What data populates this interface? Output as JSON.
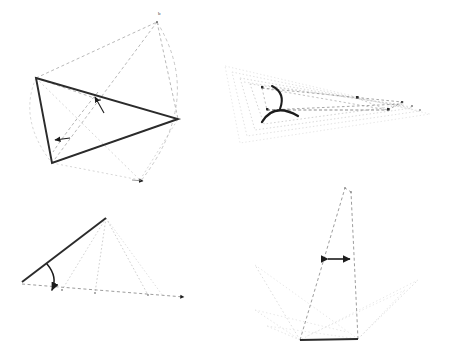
{
  "document": {
    "title": "Geometric Angle Constructions",
    "background_color": "#ffffff",
    "figure_count": 4
  },
  "palette": {
    "solid_stroke": "#2b2b2b",
    "dashed_stroke": "#8c8c8c",
    "dotted_faint": "#d2d2d2",
    "dotted_mid": "#b4b4b4",
    "arc_stroke": "#1c1c1c",
    "marker_fill": "#1c1c1c",
    "label_color": "#3a3a3a"
  },
  "figures": [
    {
      "id": "fig-1",
      "name": "quadrilateral-rotation-construction",
      "position": "top-left",
      "labels": [
        {
          "text": "b",
          "x": 160,
          "y": 14
        }
      ],
      "solid_polyline": [
        [
          36,
          78
        ],
        [
          178,
          119
        ],
        [
          52,
          163
        ],
        [
          36,
          78
        ]
      ],
      "dashed_lines": [
        [
          [
            36,
            78
          ],
          [
            157,
            22
          ]
        ],
        [
          [
            157,
            22
          ],
          [
            178,
            119
          ]
        ],
        [
          [
            157,
            22
          ],
          [
            52,
            163
          ]
        ],
        [
          [
            52,
            163
          ],
          [
            178,
            119
          ]
        ],
        [
          [
            36,
            78
          ],
          [
            140,
            180
          ]
        ],
        [
          [
            52,
            163
          ],
          [
            140,
            180
          ]
        ],
        [
          [
            140,
            180
          ],
          [
            178,
            119
          ]
        ],
        [
          [
            36,
            78
          ],
          [
            96,
            96
          ]
        ]
      ],
      "dashed_arcs": [
        {
          "from": [
            157,
            22
          ],
          "to": [
            140,
            182
          ],
          "bow": 28
        },
        {
          "from": [
            36,
            78
          ],
          "to": [
            52,
            163
          ],
          "bow": -22
        },
        {
          "from": [
            96,
            94
          ],
          "to": [
            52,
            150
          ],
          "bow": 16
        }
      ],
      "arrow_markers": [
        {
          "x": 93,
          "y": 100,
          "angle": -52
        },
        {
          "x": 54,
          "y": 140,
          "angle": 188
        },
        {
          "x": 141,
          "y": 181,
          "angle": 8
        }
      ],
      "vertex_dots": [
        [
          36,
          78
        ],
        [
          178,
          119
        ],
        [
          52,
          163
        ],
        [
          157,
          22
        ],
        [
          140,
          180
        ],
        [
          96,
          96
        ]
      ]
    },
    {
      "id": "fig-2",
      "name": "nested-triangle-angle-arcs",
      "position": "top-right",
      "labels": [],
      "solid_polyline": [],
      "dotted_polygons": [
        [
          [
            3,
            18
          ],
          [
            205,
            66
          ],
          [
            18,
            95
          ],
          [
            3,
            18
          ]
        ],
        [
          [
            10,
            24
          ],
          [
            196,
            62
          ],
          [
            25,
            88
          ],
          [
            10,
            24
          ]
        ],
        [
          [
            18,
            30
          ],
          [
            188,
            59
          ],
          [
            33,
            82
          ],
          [
            18,
            30
          ]
        ],
        [
          [
            28,
            36
          ],
          [
            180,
            56
          ],
          [
            42,
            76
          ],
          [
            28,
            36
          ]
        ]
      ],
      "dashed_lines": [
        [
          [
            40,
            40
          ],
          [
            178,
            54
          ]
        ],
        [
          [
            40,
            40
          ],
          [
            166,
            62
          ]
        ],
        [
          [
            45,
            62
          ],
          [
            180,
            56
          ]
        ],
        [
          [
            45,
            62
          ],
          [
            166,
            62
          ]
        ],
        [
          [
            40,
            40
          ],
          [
            45,
            62
          ]
        ],
        [
          [
            166,
            62
          ],
          [
            178,
            54
          ]
        ],
        [
          [
            135,
            50
          ],
          [
            166,
            62
          ]
        ],
        [
          [
            135,
            50
          ],
          [
            40,
            40
          ]
        ]
      ],
      "angle_arcs": [
        {
          "cx": 47,
          "cy": 44,
          "r": 14,
          "start_deg": -30,
          "end_deg": 72,
          "bold": true
        },
        {
          "cx": 52,
          "cy": 64,
          "r": 16,
          "start_deg": -100,
          "end_deg": 28,
          "bold": true
        }
      ],
      "vertex_dots": [
        [
          40,
          40
        ],
        [
          45,
          62
        ],
        [
          135,
          50
        ],
        [
          166,
          62
        ],
        [
          178,
          54
        ],
        [
          188,
          57
        ],
        [
          196,
          60
        ]
      ]
    },
    {
      "id": "fig-3",
      "name": "ray-rotation-angle-arc",
      "position": "bottom-left",
      "labels": [],
      "solid_lines": [
        [
          [
            22,
            87
          ],
          [
            106,
            23
          ]
        ]
      ],
      "dashed_baseline": {
        "from": [
          22,
          89
        ],
        "to": [
          188,
          103
        ],
        "arrowhead": true
      },
      "dotted_fan": [
        [
          [
            106,
            23
          ],
          [
            62,
            95
          ]
        ],
        [
          [
            106,
            23
          ],
          [
            95,
            98
          ]
        ],
        [
          [
            106,
            23
          ],
          [
            148,
            100
          ]
        ],
        [
          [
            106,
            23
          ],
          [
            162,
            101
          ]
        ]
      ],
      "angle_arcs": [
        {
          "cx": 30,
          "cy": 90,
          "r": 28,
          "start_deg": -42,
          "end_deg": -2,
          "bold": true,
          "arrow_end": true
        }
      ],
      "vertex_dots": [
        [
          22,
          88
        ],
        [
          106,
          23
        ],
        [
          62,
          95
        ],
        [
          95,
          98
        ],
        [
          148,
          100
        ]
      ]
    },
    {
      "id": "fig-4",
      "name": "tall-triangle-width-marker",
      "position": "bottom-right",
      "labels": [],
      "solid_lines": [
        [
          [
            45,
            160
          ],
          [
            103,
            159
          ]
        ]
      ],
      "dashed_lines": [
        [
          [
            45,
            160
          ],
          [
            90,
            8
          ]
        ],
        [
          [
            103,
            159
          ],
          [
            96,
            12
          ]
        ],
        [
          [
            90,
            8
          ],
          [
            96,
            12
          ]
        ],
        [
          [
            45,
            160
          ],
          [
            103,
            159
          ]
        ]
      ],
      "dotted_fan": [
        [
          [
            45,
            160
          ],
          [
            0,
            85
          ]
        ],
        [
          [
            45,
            160
          ],
          [
            0,
            130
          ]
        ],
        [
          [
            45,
            160
          ],
          [
            10,
            146
          ]
        ],
        [
          [
            103,
            159
          ],
          [
            160,
            100
          ]
        ],
        [
          [
            103,
            159
          ],
          [
            150,
            108
          ]
        ],
        [
          [
            0,
            85
          ],
          [
            103,
            159
          ]
        ],
        [
          [
            0,
            130
          ],
          [
            90,
            150
          ]
        ],
        [
          [
            160,
            100
          ],
          [
            45,
            160
          ]
        ],
        [
          [
            10,
            146
          ],
          [
            103,
            159
          ]
        ]
      ],
      "dimension_marker": {
        "from": [
          72,
          79
        ],
        "to": [
          95,
          79
        ],
        "arrowheads": "both",
        "bold": true
      },
      "vertex_dots": [
        [
          45,
          160
        ],
        [
          103,
          159
        ],
        [
          90,
          8
        ],
        [
          96,
          12
        ],
        [
          72,
          79
        ],
        [
          95,
          79
        ]
      ]
    }
  ]
}
